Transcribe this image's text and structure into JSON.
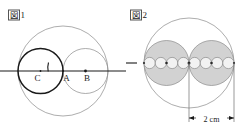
{
  "figure1": {
    "label_cjk": "図",
    "label_number": "1",
    "points": [
      {
        "name": "C",
        "label": "C"
      },
      {
        "name": "A",
        "label": "A"
      },
      {
        "name": "B",
        "label": "B"
      }
    ]
  },
  "figure2": {
    "label_cjk": "図",
    "label_number": "2",
    "dimension": {
      "value": "2",
      "unit": "cm",
      "text": "2 cm"
    },
    "inner_circle_count": 2,
    "small_circle_count_per_group": 4
  },
  "colors": {
    "stroke_dark": "#1a1a1a",
    "stroke_light": "#7d7d7d",
    "fill_gray": "#d2d2d2",
    "fill_white": "#ffffff",
    "background": "#ffffff"
  }
}
